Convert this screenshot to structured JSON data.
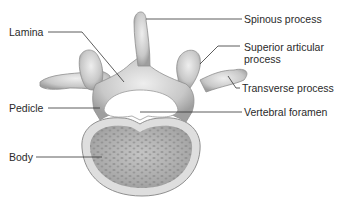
{
  "diagram": {
    "labels": {
      "spinous_process": "Spinous process",
      "superior_articular_process": "Superior articular process",
      "transverse_process": "Transverse process",
      "lamina": "Lamina",
      "pedicle": "Pedicle",
      "vertebral_foramen": "Vertebral foramen",
      "body": "Body"
    },
    "colors": {
      "bone": "#c9c9c9",
      "bone_light": "#e6e6e6",
      "bone_shadow": "#9a9a9a",
      "body_inner": "#b8b8b8",
      "leader_line": "#333333",
      "text": "#2a2a2a"
    }
  }
}
